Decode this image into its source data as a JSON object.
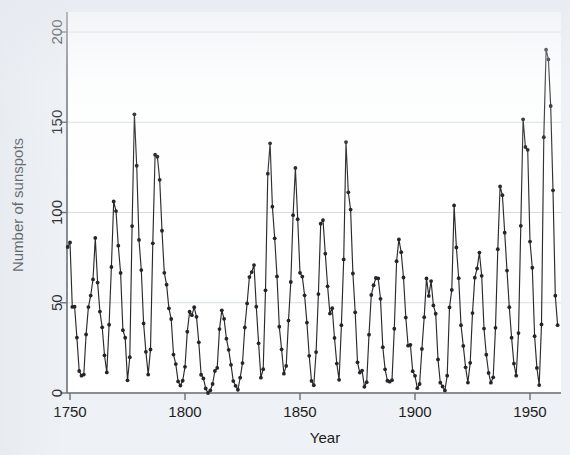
{
  "chart_data": {
    "type": "line",
    "title": "",
    "subtitle": "",
    "xlabel": "Year",
    "ylabel": "Number of sunspots",
    "xlim": [
      1749,
      1962
    ],
    "ylim": [
      0,
      205
    ],
    "xticks": [
      1750,
      1800,
      1850,
      1900,
      1950
    ],
    "xtick_labels": [
      "1750",
      "1800",
      "1850",
      "1900",
      "1950"
    ],
    "yticks": [
      0,
      50,
      100,
      150,
      200
    ],
    "ytick_labels": [
      "0",
      "50",
      "100",
      "150",
      "200"
    ],
    "grid": "horizontal",
    "legend": "none",
    "markers": "filled-circle",
    "line_color": "#2a2a2e",
    "marker_color": "#24242a",
    "plot_background": "#ffffff",
    "figure_background": "#eef1f5",
    "grid_color": "#d9dde3",
    "axis_color": "#6b6f75",
    "series": [
      {
        "name": "Sunspot number",
        "x": [
          1749,
          1750,
          1751,
          1752,
          1753,
          1754,
          1755,
          1756,
          1757,
          1758,
          1759,
          1760,
          1761,
          1762,
          1763,
          1764,
          1765,
          1766,
          1767,
          1768,
          1769,
          1770,
          1771,
          1772,
          1773,
          1774,
          1775,
          1776,
          1777,
          1778,
          1779,
          1780,
          1781,
          1782,
          1783,
          1784,
          1785,
          1786,
          1787,
          1788,
          1789,
          1790,
          1791,
          1792,
          1793,
          1794,
          1795,
          1796,
          1797,
          1798,
          1799,
          1800,
          1801,
          1802,
          1803,
          1804,
          1805,
          1806,
          1807,
          1808,
          1809,
          1810,
          1811,
          1812,
          1813,
          1814,
          1815,
          1816,
          1817,
          1818,
          1819,
          1820,
          1821,
          1822,
          1823,
          1824,
          1825,
          1826,
          1827,
          1828,
          1829,
          1830,
          1831,
          1832,
          1833,
          1834,
          1835,
          1836,
          1837,
          1838,
          1839,
          1840,
          1841,
          1842,
          1843,
          1844,
          1845,
          1846,
          1847,
          1848,
          1849,
          1850,
          1851,
          1852,
          1853,
          1854,
          1855,
          1856,
          1857,
          1858,
          1859,
          1860,
          1861,
          1862,
          1863,
          1864,
          1865,
          1866,
          1867,
          1868,
          1869,
          1870,
          1871,
          1872,
          1873,
          1874,
          1875,
          1876,
          1877,
          1878,
          1879,
          1880,
          1881,
          1882,
          1883,
          1884,
          1885,
          1886,
          1887,
          1888,
          1889,
          1890,
          1891,
          1892,
          1893,
          1894,
          1895,
          1896,
          1897,
          1898,
          1899,
          1900,
          1901,
          1902,
          1903,
          1904,
          1905,
          1906,
          1907,
          1908,
          1909,
          1910,
          1911,
          1912,
          1913,
          1914,
          1915,
          1916,
          1917,
          1918,
          1919,
          1920,
          1921,
          1922,
          1923,
          1924,
          1925,
          1926,
          1927,
          1928,
          1929,
          1930,
          1931,
          1932,
          1933,
          1934,
          1935,
          1936,
          1937,
          1938,
          1939,
          1940,
          1941,
          1942,
          1943,
          1944,
          1945,
          1946,
          1947,
          1948,
          1949,
          1950,
          1951,
          1952,
          1953,
          1954,
          1955,
          1956,
          1957,
          1958,
          1959,
          1960,
          1961,
          1962
        ],
        "values": [
          80.9,
          83.4,
          47.7,
          47.8,
          30.7,
          12.2,
          9.6,
          10.2,
          32.4,
          47.6,
          54.0,
          62.9,
          85.9,
          61.2,
          45.1,
          36.4,
          20.9,
          11.4,
          37.8,
          69.8,
          106.1,
          100.8,
          81.6,
          66.5,
          34.8,
          30.6,
          7.0,
          19.8,
          92.5,
          154.4,
          125.9,
          84.8,
          68.1,
          38.5,
          22.8,
          10.2,
          24.1,
          82.9,
          132.0,
          130.9,
          118.1,
          89.9,
          66.6,
          60.0,
          46.9,
          41.0,
          21.3,
          16.0,
          6.4,
          4.1,
          6.8,
          14.5,
          34.0,
          45.0,
          43.1,
          47.5,
          42.2,
          28.1,
          10.1,
          8.1,
          2.5,
          0.0,
          1.4,
          5.0,
          12.2,
          13.9,
          35.4,
          45.8,
          41.1,
          30.1,
          23.9,
          15.6,
          6.6,
          4.0,
          1.8,
          8.5,
          16.6,
          36.3,
          49.6,
          64.2,
          67.0,
          70.9,
          47.8,
          27.5,
          8.5,
          13.2,
          56.9,
          121.5,
          138.3,
          103.2,
          85.7,
          64.6,
          36.7,
          24.2,
          10.7,
          15.0,
          40.1,
          61.5,
          98.5,
          124.7,
          96.3,
          66.6,
          64.5,
          54.1,
          39.0,
          20.6,
          6.7,
          4.3,
          22.7,
          54.8,
          93.8,
          95.8,
          77.2,
          59.1,
          44.0,
          47.0,
          30.5,
          16.3,
          7.3,
          37.6,
          74.0,
          139.0,
          111.2,
          101.6,
          66.2,
          44.7,
          17.0,
          11.3,
          12.4,
          3.4,
          6.0,
          32.3,
          54.3,
          59.7,
          63.7,
          63.5,
          52.2,
          25.4,
          13.1,
          6.8,
          6.3,
          7.1,
          35.6,
          73.0,
          85.1,
          78.0,
          64.0,
          41.8,
          26.2,
          26.7,
          12.1,
          9.5,
          2.7,
          5.0,
          24.4,
          42.0,
          63.5,
          53.8,
          62.0,
          48.5,
          43.9,
          18.6,
          5.7,
          3.6,
          1.4,
          9.6,
          47.4,
          57.1,
          103.9,
          80.6,
          63.6,
          37.6,
          26.1,
          14.2,
          5.8,
          16.7,
          44.3,
          63.9,
          69.0,
          77.8,
          64.9,
          35.7,
          21.2,
          11.1,
          5.7,
          8.7,
          36.1,
          79.7,
          114.4,
          109.6,
          88.8,
          67.8,
          47.5,
          30.6,
          16.3,
          9.6,
          33.2,
          92.6,
          151.6,
          136.3,
          134.7,
          83.9,
          69.4,
          31.5,
          13.9,
          4.4,
          38.0,
          141.7,
          190.2,
          184.8,
          159.0,
          112.3,
          53.9,
          37.6
        ]
      }
    ]
  },
  "axis": {
    "x_title": "Year",
    "y_title": "Number of sunspots"
  }
}
